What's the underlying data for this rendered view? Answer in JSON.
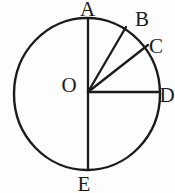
{
  "figure": {
    "type": "geometry-circle-diagram",
    "labels": {
      "top": "A",
      "upper_right_outer": "B",
      "upper_right_inner": "C",
      "right": "D",
      "bottom": "E",
      "center": "O"
    },
    "segments": [
      "AE vertical diameter through O",
      "OB radius (about 30 degrees from vertical)",
      "OC radius (about 38 degrees above horizontal)",
      "OD horizontal radius"
    ],
    "colors": {
      "stroke": "#1b1b1b",
      "background": "#fdfdfd"
    }
  }
}
